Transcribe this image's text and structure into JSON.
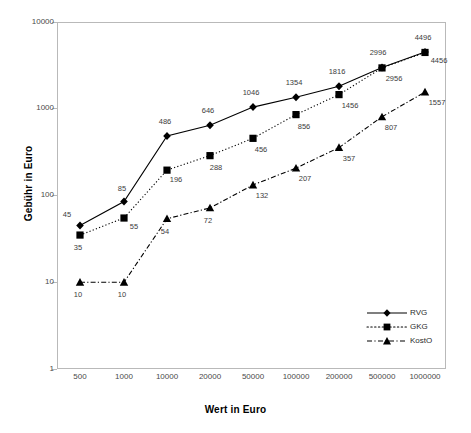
{
  "chart_data": {
    "type": "line",
    "title": "",
    "xlabel": "Wert in Euro",
    "ylabel": "Gebühr in Euro",
    "x_scale": "category",
    "y_scale": "log",
    "ylim": [
      1,
      10000
    ],
    "y_ticks": [
      "1",
      "10",
      "100",
      "1000",
      "10000"
    ],
    "grid": false,
    "legend_position": "bottom-right",
    "categories": [
      "500",
      "1000",
      "10000",
      "20000",
      "50000",
      "100000",
      "200000",
      "500000",
      "1000000"
    ],
    "series": [
      {
        "name": "RVG",
        "marker": "diamond",
        "line_style": "solid",
        "color": "#000000",
        "values": [
          45,
          85,
          486,
          646,
          1046,
          1354,
          1816,
          2996,
          4496
        ],
        "labels": [
          "45",
          "85",
          "486",
          "646",
          "1046",
          "1354",
          "1816",
          "2996",
          "4496"
        ]
      },
      {
        "name": "GKG",
        "marker": "square",
        "line_style": "dotted",
        "color": "#000000",
        "values": [
          35,
          55,
          196,
          288,
          456,
          856,
          1456,
          2956,
          4456
        ],
        "labels": [
          "35",
          "55",
          "196",
          "288",
          "456",
          "856",
          "1456",
          "2956",
          "4456"
        ]
      },
      {
        "name": "KostO",
        "marker": "triangle",
        "line_style": "dash-dot",
        "color": "#000000",
        "values": [
          10,
          10,
          54,
          72,
          132,
          207,
          357,
          807,
          1557
        ],
        "labels": [
          "10",
          "10",
          "54",
          "72",
          "132",
          "207",
          "357",
          "807",
          "1557"
        ]
      }
    ]
  },
  "axes": {
    "y_title": "Gebühr in Euro",
    "x_title": "Wert in Euro",
    "y_ticks": [
      "10000",
      "1000",
      "100",
      "10",
      "1"
    ],
    "x_ticks": [
      "500",
      "1000",
      "10000",
      "20000",
      "50000",
      "100000",
      "200000",
      "500000",
      "1000000"
    ]
  },
  "legend": {
    "entries": [
      {
        "label": "RVG"
      },
      {
        "label": "GKG"
      },
      {
        "label": "KostO"
      }
    ]
  }
}
